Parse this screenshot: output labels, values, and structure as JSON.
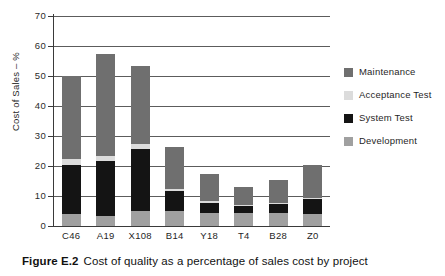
{
  "figure": {
    "caption_label": "Figure E.2",
    "caption_text": "Cost of quality as a percentage of sales cost by project"
  },
  "legend": {
    "position": "right",
    "entries": [
      {
        "label": "Maintenance",
        "color": "#6f6f6f"
      },
      {
        "label": "Acceptance Test",
        "color": "#dcdcdc"
      },
      {
        "label": "System Test",
        "color": "#141414"
      },
      {
        "label": "Development",
        "color": "#a0a0a0"
      }
    ]
  },
  "chart_data": {
    "type": "bar",
    "subtype": "stacked-vertical",
    "title": "",
    "xlabel": "",
    "ylabel": "Cost of Sales – %",
    "ylim": [
      0,
      70
    ],
    "yticks": [
      0,
      10,
      20,
      30,
      40,
      50,
      60,
      70
    ],
    "ytick_labels": [
      "0",
      "10",
      "20",
      "30",
      "40",
      "50",
      "60",
      "70"
    ],
    "grid": "horizontal",
    "categories": [
      "C46",
      "A19",
      "X108",
      "B14",
      "Y18",
      "T4",
      "B28",
      "Z0"
    ],
    "series": [
      {
        "name": "Development",
        "color": "#a0a0a0",
        "values": [
          4.0,
          3.5,
          5.0,
          5.0,
          4.5,
          4.2,
          4.5,
          4.0
        ]
      },
      {
        "name": "System Test",
        "color": "#141414",
        "values": [
          16.2,
          18.2,
          20.7,
          6.8,
          3.3,
          2.4,
          2.9,
          5.0
        ]
      },
      {
        "name": "Acceptance Test",
        "color": "#dcdcdc",
        "values": [
          2.0,
          1.8,
          1.8,
          0.7,
          0.5,
          0.5,
          0.4,
          0.5
        ]
      },
      {
        "name": "Maintenance",
        "color": "#6f6f6f",
        "values": [
          27.8,
          34.0,
          26.0,
          13.8,
          9.0,
          5.9,
          7.7,
          11.0
        ]
      }
    ],
    "totals": [
      50.0,
      57.5,
      53.5,
      26.3,
      17.3,
      13.0,
      15.5,
      20.5
    ]
  }
}
